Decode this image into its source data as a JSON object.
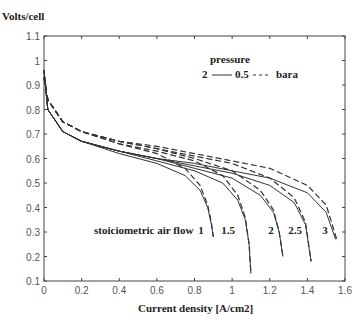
{
  "chart_data": {
    "type": "line",
    "title": "",
    "ylabel": "Volts/cell",
    "xlabel": "Current density [A/cm2]",
    "xlim": [
      0,
      1.6
    ],
    "ylim": [
      0.1,
      1.1
    ],
    "xticks": [
      "0",
      "0.2",
      "0.4",
      "0.6",
      "0.8",
      "1",
      "1.2",
      "1.4",
      "1.6"
    ],
    "yticks": [
      "0.1",
      "0.2",
      "0.3",
      "0.4",
      "0.5",
      "0.6",
      "0.7",
      "0.8",
      "0.9",
      "1",
      "1.1"
    ],
    "grid": false,
    "legend": {
      "title": "pressure",
      "solid_label": "2",
      "dashed_label": "0.5",
      "unit": "bara",
      "position": "upper right"
    },
    "annotation": "stoiciometric air flow",
    "stoich_labels": [
      "1",
      "1.5",
      "2",
      "2.5",
      "3"
    ],
    "series": [
      {
        "name": "2 bara, stoich 1",
        "style": "solid",
        "x": [
          0,
          0.02,
          0.1,
          0.2,
          0.4,
          0.6,
          0.75,
          0.83,
          0.87,
          0.89,
          0.9
        ],
        "y": [
          0.96,
          0.8,
          0.71,
          0.67,
          0.62,
          0.58,
          0.53,
          0.47,
          0.4,
          0.33,
          0.28
        ]
      },
      {
        "name": "0.5 bara, stoich 1",
        "style": "dashed",
        "x": [
          0,
          0.02,
          0.1,
          0.2,
          0.4,
          0.6,
          0.75,
          0.83,
          0.87,
          0.89,
          0.9
        ],
        "y": [
          0.93,
          0.84,
          0.75,
          0.71,
          0.66,
          0.62,
          0.56,
          0.49,
          0.41,
          0.34,
          0.28
        ]
      },
      {
        "name": "2 bara, stoich 1.5",
        "style": "solid",
        "x": [
          0,
          0.02,
          0.1,
          0.2,
          0.4,
          0.6,
          0.8,
          0.95,
          1.03,
          1.07,
          1.09,
          1.1
        ],
        "y": [
          0.96,
          0.8,
          0.71,
          0.67,
          0.63,
          0.59,
          0.55,
          0.5,
          0.43,
          0.35,
          0.25,
          0.13
        ]
      },
      {
        "name": "0.5 bara, stoich 1.5",
        "style": "dashed",
        "x": [
          0,
          0.02,
          0.1,
          0.2,
          0.4,
          0.6,
          0.8,
          0.95,
          1.03,
          1.07,
          1.09,
          1.1
        ],
        "y": [
          0.93,
          0.84,
          0.75,
          0.71,
          0.66,
          0.63,
          0.59,
          0.53,
          0.45,
          0.36,
          0.25,
          0.13
        ]
      },
      {
        "name": "2 bara, stoich 2",
        "style": "solid",
        "x": [
          0,
          0.02,
          0.1,
          0.2,
          0.4,
          0.6,
          0.8,
          1.0,
          1.15,
          1.22,
          1.25,
          1.27
        ],
        "y": [
          0.96,
          0.8,
          0.71,
          0.67,
          0.63,
          0.6,
          0.56,
          0.52,
          0.45,
          0.38,
          0.3,
          0.2
        ]
      },
      {
        "name": "0.5 bara, stoich 2",
        "style": "dashed",
        "x": [
          0,
          0.02,
          0.1,
          0.2,
          0.4,
          0.6,
          0.8,
          1.0,
          1.15,
          1.22,
          1.25,
          1.27
        ],
        "y": [
          0.93,
          0.84,
          0.75,
          0.71,
          0.67,
          0.64,
          0.6,
          0.55,
          0.47,
          0.39,
          0.3,
          0.2
        ]
      },
      {
        "name": "2 bara, stoich 2.5",
        "style": "solid",
        "x": [
          0,
          0.02,
          0.1,
          0.2,
          0.4,
          0.6,
          0.8,
          1.0,
          1.2,
          1.33,
          1.39,
          1.42
        ],
        "y": [
          0.96,
          0.8,
          0.71,
          0.67,
          0.63,
          0.6,
          0.57,
          0.54,
          0.49,
          0.42,
          0.33,
          0.18
        ]
      },
      {
        "name": "0.5 bara, stoich 2.5",
        "style": "dashed",
        "x": [
          0,
          0.02,
          0.1,
          0.2,
          0.4,
          0.6,
          0.8,
          1.0,
          1.2,
          1.33,
          1.39,
          1.42
        ],
        "y": [
          0.93,
          0.84,
          0.75,
          0.71,
          0.67,
          0.64,
          0.61,
          0.58,
          0.52,
          0.44,
          0.34,
          0.18
        ]
      },
      {
        "name": "2 bara, stoich 3",
        "style": "solid",
        "x": [
          0,
          0.02,
          0.1,
          0.2,
          0.4,
          0.6,
          0.8,
          1.0,
          1.2,
          1.4,
          1.5,
          1.55
        ],
        "y": [
          0.96,
          0.8,
          0.71,
          0.67,
          0.63,
          0.6,
          0.58,
          0.55,
          0.52,
          0.46,
          0.38,
          0.27
        ]
      },
      {
        "name": "0.5 bara, stoich 3",
        "style": "dashed",
        "x": [
          0,
          0.02,
          0.1,
          0.2,
          0.4,
          0.6,
          0.8,
          1.0,
          1.2,
          1.4,
          1.5,
          1.56
        ],
        "y": [
          0.93,
          0.84,
          0.75,
          0.71,
          0.67,
          0.65,
          0.62,
          0.59,
          0.56,
          0.49,
          0.41,
          0.26
        ]
      }
    ]
  }
}
